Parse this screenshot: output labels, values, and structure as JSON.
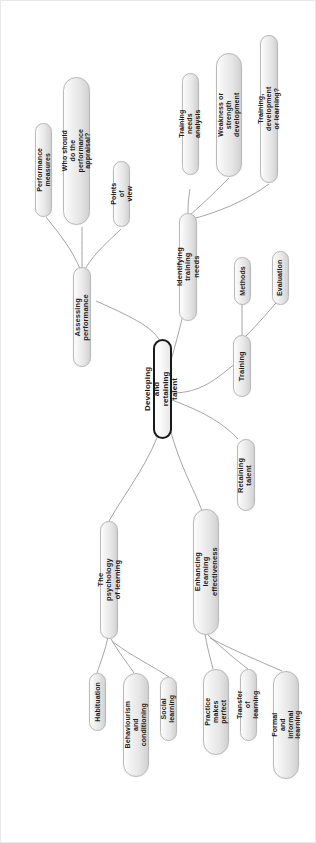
{
  "diagram": {
    "title": "Developing and retaining talent",
    "type": "mind-map",
    "orientation": "rotated-90-counterclockwise",
    "root": {
      "id": "root",
      "label": "Developing and retaining talent"
    },
    "nodes": [
      {
        "id": "assessing-performance",
        "label": "Assessing performance",
        "parent": "root"
      },
      {
        "id": "performance-measures",
        "label": "Performance measures",
        "parent": "assessing-performance"
      },
      {
        "id": "who-should-do-appraisal",
        "label": "Who should do the performance\nappraisal?",
        "parent": "assessing-performance"
      },
      {
        "id": "points-of-view",
        "label": "Points of view",
        "parent": "assessing-performance"
      },
      {
        "id": "identifying-training-needs",
        "label": "Identifying training needs",
        "parent": "root"
      },
      {
        "id": "training-needs-analysis",
        "label": "Training needs analysis",
        "parent": "identifying-training-needs"
      },
      {
        "id": "weakness-or-strength-development",
        "label": "Weakness or strength\ndevelopment",
        "parent": "identifying-training-needs"
      },
      {
        "id": "training-development-or-learning",
        "label": "Training, development or learning?",
        "parent": "identifying-training-needs"
      },
      {
        "id": "training",
        "label": "Training",
        "parent": "root"
      },
      {
        "id": "methods",
        "label": "Methods",
        "parent": "training"
      },
      {
        "id": "evaluation",
        "label": "Evaluation",
        "parent": "training"
      },
      {
        "id": "retaining-talent",
        "label": "Retaining talent",
        "parent": "root"
      },
      {
        "id": "psychology-of-learning",
        "label": "The psychology of learning",
        "parent": "root"
      },
      {
        "id": "habituation",
        "label": "Habituation",
        "parent": "psychology-of-learning"
      },
      {
        "id": "behaviourism-and-conditioning",
        "label": "Behaviourism and\nconditioning",
        "parent": "psychology-of-learning"
      },
      {
        "id": "social-learning",
        "label": "Social learning",
        "parent": "psychology-of-learning"
      },
      {
        "id": "enhancing-learning-effectiveness",
        "label": "Enhancing learning\neffectiveness",
        "parent": "root"
      },
      {
        "id": "practice-makes-perfect",
        "label": "Practice makes\nperfect",
        "parent": "enhancing-learning-effectiveness"
      },
      {
        "id": "transfer-of-learning",
        "label": "Transfer of learning",
        "parent": "enhancing-learning-effectiveness"
      },
      {
        "id": "formal-and-informal-learning",
        "label": "Formal and informal\nlearning",
        "parent": "enhancing-learning-effectiveness"
      }
    ],
    "colors": {
      "node_fill_light": "#fdfdfd",
      "node_fill_dark": "#cfcfcf",
      "node_border": "#b9b9b9",
      "root_border": "#1a1a1a",
      "link": "#8e8e8e",
      "text": "#1b1b1b",
      "background": "#ffffff"
    }
  }
}
